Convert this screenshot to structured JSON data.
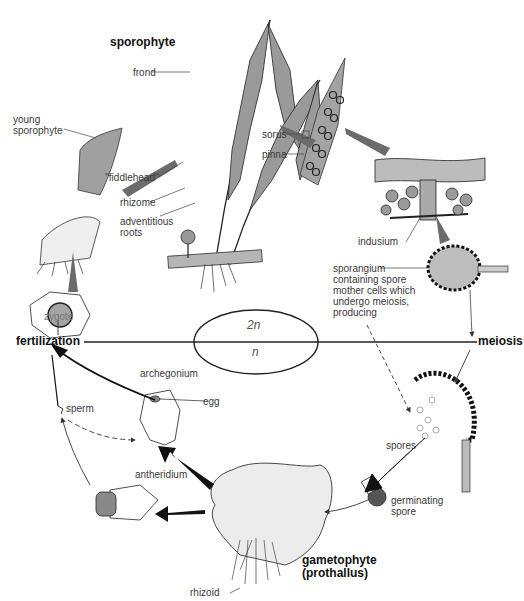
{
  "diagram": {
    "ploidy": {
      "diploid": "2n",
      "haploid": "n"
    },
    "stages": {
      "sporophyte": "sporophyte",
      "meiosis": "meiosis",
      "fertilization": "fertilization",
      "gametophyte": "gametophyte\n(prothallus)"
    },
    "labels": {
      "frond": "frond",
      "young_sporophyte": "young\nsporophyte",
      "fiddlehead": "''fiddlehead''",
      "rhizome": "rhizome",
      "adventitious_roots": "adventitious\nroots",
      "sorus": "sorus",
      "pinna": "pinna",
      "indusium": "indusium",
      "sporangium": "sporangium\ncontaining spore\nmother cells which\nundergo meiosis,\nproducing",
      "spores": "spores",
      "germinating_spore": "germinating\nspore",
      "rhizoid": "rhizoid",
      "antheridium": "antheridium",
      "archegonium": "archegonium",
      "egg": "egg",
      "sperm": "sperm",
      "zygote": "zygote"
    },
    "colors": {
      "ink": "#222222",
      "arrow_gray": "#6b6b6b",
      "fill_gray": "#a8a8a8",
      "text": "#3a3a3a"
    }
  }
}
